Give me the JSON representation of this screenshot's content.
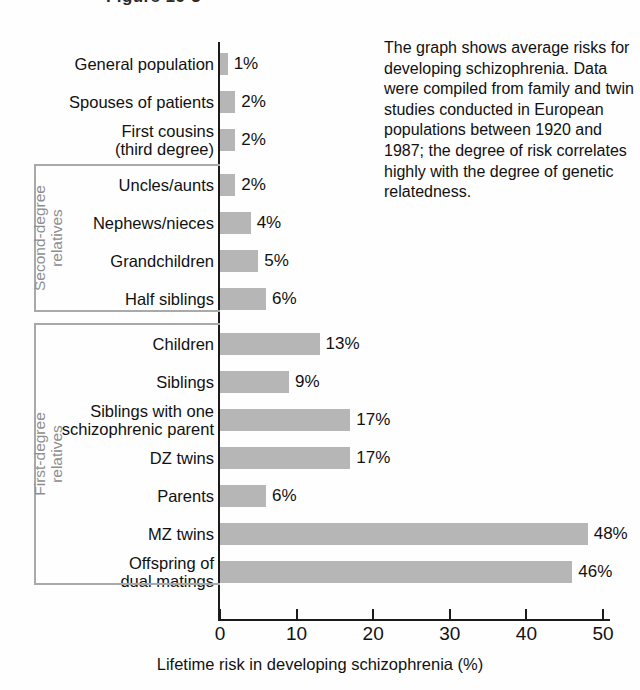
{
  "figure": {
    "title_sliver": "Figure 16-3",
    "note": "The graph shows average risks for developing schizophrenia. Data were compiled from family and twin studies conducted in European populations between 1920 and 1987; the degree of risk correlates highly with the degree of genetic relatedness."
  },
  "chart_data": {
    "type": "bar",
    "orientation": "horizontal",
    "title": "",
    "xlabel": "Lifetime risk in developing schizophrenia (%)",
    "ylabel": "",
    "xlim": [
      0,
      50
    ],
    "xticks": [
      0,
      10,
      20,
      30,
      40,
      50
    ],
    "xticklabels": [
      "0",
      "10",
      "20",
      "30",
      "40",
      "50"
    ],
    "grid": false,
    "legend": null,
    "bar_color": "#b6b6b6",
    "axis_color": "#1b1b1b",
    "bracket_color": "#a9a9a9",
    "categories": [
      "General population",
      "Spouses of patients",
      "First cousins\n(third degree)",
      "Uncles/aunts",
      "Nephews/nieces",
      "Grandchildren",
      "Half siblings",
      "Children",
      "Siblings",
      "Siblings with one\nschizophrenic parent",
      "DZ twins",
      "Parents",
      "MZ twins",
      "Offspring of\ndual matings"
    ],
    "values": [
      1,
      2,
      2,
      2,
      4,
      5,
      6,
      13,
      9,
      17,
      17,
      6,
      48,
      46
    ],
    "value_labels": [
      "1%",
      "2%",
      "2%",
      "2%",
      "4%",
      "5%",
      "6%",
      "13%",
      "9%",
      "17%",
      "17%",
      "6%",
      "48%",
      "46%"
    ],
    "groups": [
      {
        "name": "Second-degree\nrelatives",
        "first_index": 3,
        "last_index": 6
      },
      {
        "name": "First-degree\nrelatives",
        "first_index": 7,
        "last_index": 13
      }
    ]
  }
}
